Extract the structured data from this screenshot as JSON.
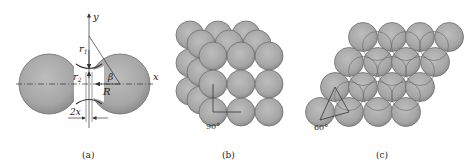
{
  "figure": {
    "panels": [
      {
        "id": "a",
        "caption": "(a)",
        "description": "Two-sphere sintering neck model",
        "labels": {
          "y_axis": "y",
          "x_axis": "x",
          "r1": "r",
          "r1_sub": "1",
          "r2": "r",
          "r2_sub": "2",
          "beta": "β",
          "R": "R",
          "neck": "2x"
        }
      },
      {
        "id": "b",
        "caption": "(b)",
        "description": "Simple cubic packing of spheres",
        "angle_label": "90°"
      },
      {
        "id": "c",
        "caption": "(c)",
        "description": "Hexagonal close packing of spheres",
        "angle_label": "60°"
      }
    ],
    "colors": {
      "sphere_fill": "#a9a9a9",
      "sphere_edge": "#6e6e6e",
      "line": "#333333",
      "background": "#ffffff"
    }
  }
}
